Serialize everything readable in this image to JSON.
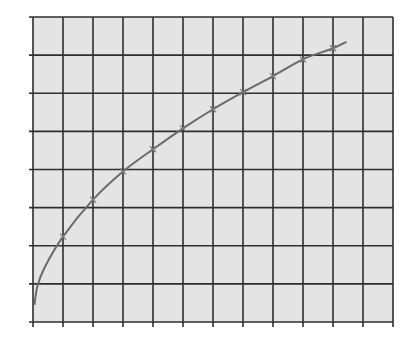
{
  "chart_data": {
    "type": "line",
    "title": "",
    "xlabel": "",
    "ylabel": "",
    "grid": true,
    "legend": null,
    "xlim": [
      0,
      12
    ],
    "ylim": [
      0,
      8
    ],
    "x_ticks": [
      0,
      1,
      2,
      3,
      4,
      5,
      6,
      7,
      8,
      9,
      10,
      11,
      12
    ],
    "y_ticks": [
      0,
      1,
      2,
      3,
      4,
      5,
      6,
      7,
      8
    ],
    "tick_labels_visible": false,
    "series": [
      {
        "name": "curve",
        "function_hint": "y ≈ 2.25·sqrt(x)",
        "marker": "x",
        "x": [
          1,
          2,
          3,
          4,
          5,
          6,
          7,
          8,
          9,
          10
        ],
        "y": [
          2.24,
          3.21,
          3.95,
          4.53,
          5.08,
          5.58,
          6.03,
          6.45,
          6.89,
          7.18
        ],
        "curve_start": [
          0.05,
          0.45
        ],
        "curve_end": [
          10.45,
          7.35
        ]
      }
    ]
  },
  "colors": {
    "background": "#ffffff",
    "plot_area": "#e4e4e4",
    "grid": "#2e2e2e",
    "curve": "#6a6a6a",
    "marker": "#7a7a7a"
  },
  "layout": {
    "plot_left": 33,
    "plot_top": 17,
    "plot_right": 393,
    "plot_bottom": 322,
    "cols": 12,
    "rows": 8
  }
}
